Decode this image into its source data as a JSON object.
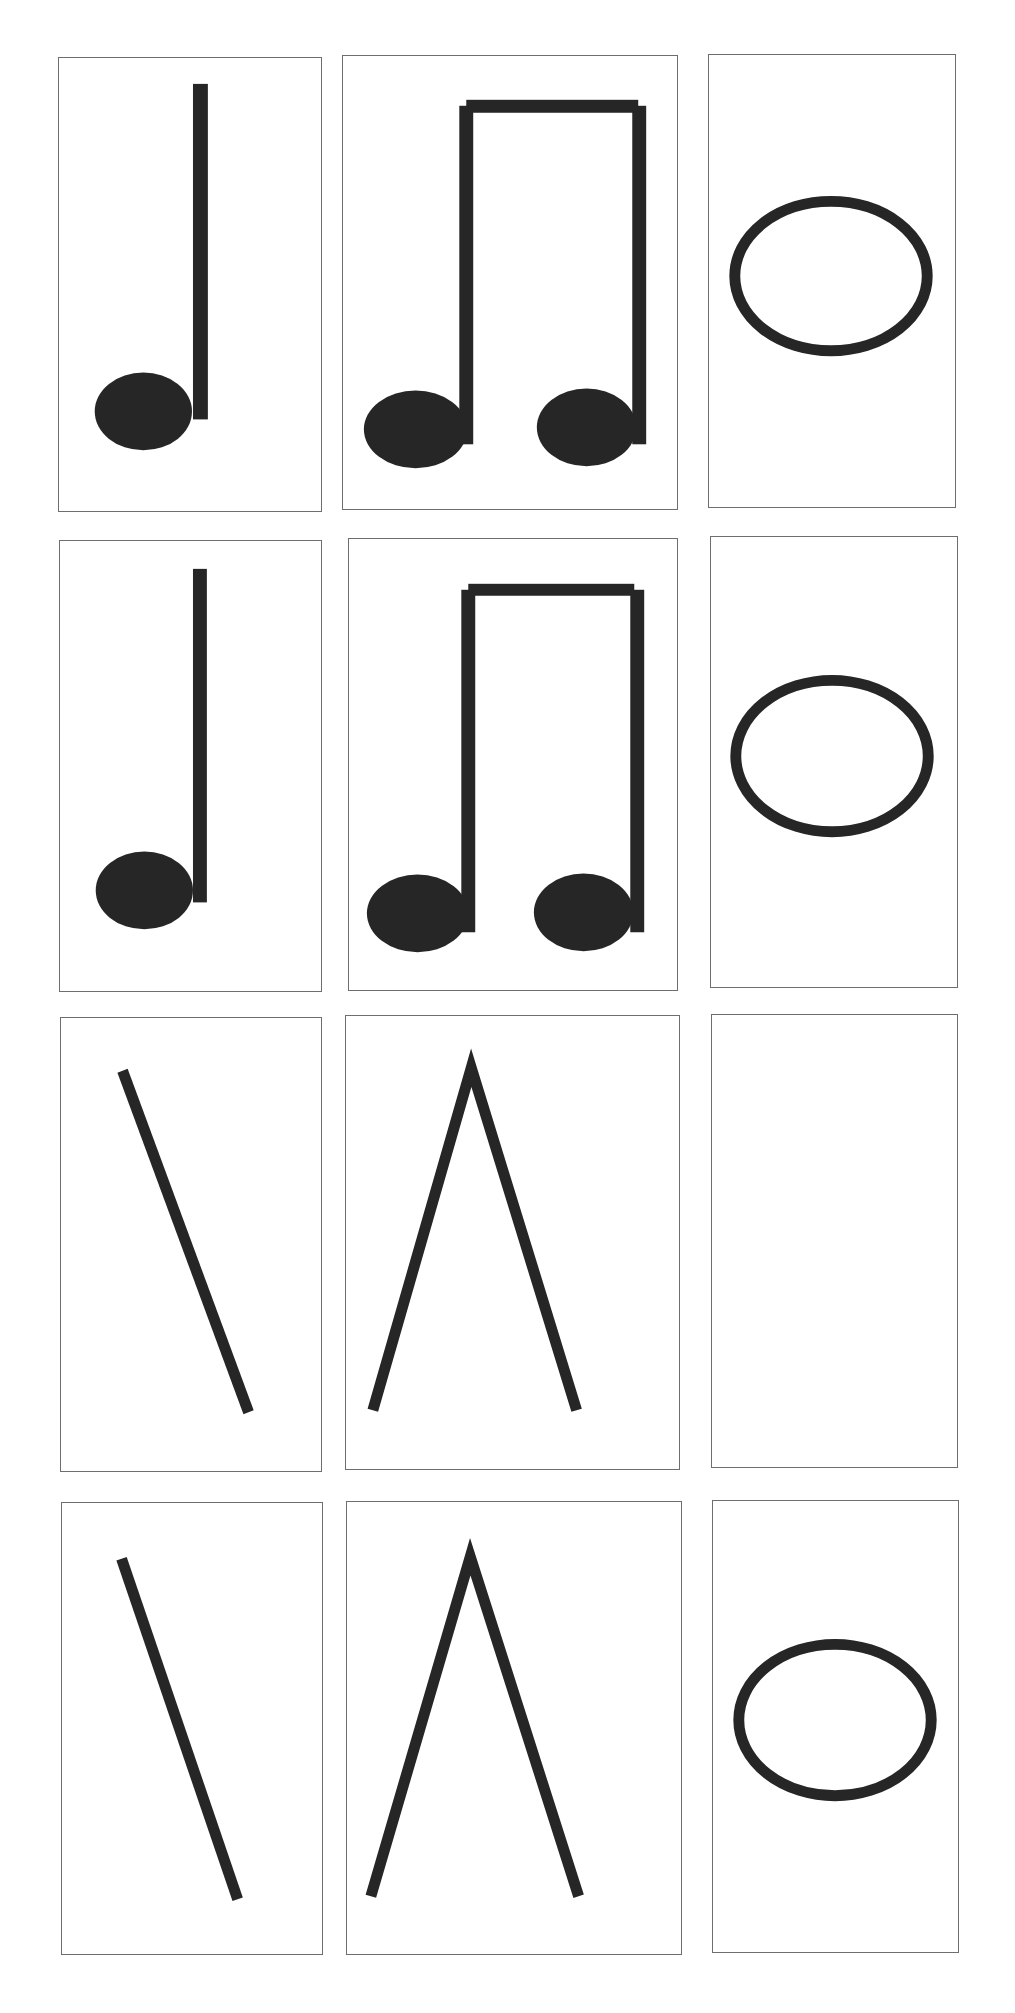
{
  "page": {
    "title": "",
    "title_note": "clipped at top edge; only descender fragments visible, text not legible"
  },
  "colors": {
    "ink": "#262626",
    "card_border": "#6e6e6e",
    "background": "#ffffff"
  },
  "grid": {
    "rows": 4,
    "columns": 3,
    "cards": [
      {
        "row": 1,
        "col": 1,
        "symbol": "quarter-note-icon",
        "notation": "standard"
      },
      {
        "row": 1,
        "col": 2,
        "symbol": "beamed-eighth-notes-icon",
        "notation": "standard"
      },
      {
        "row": 1,
        "col": 3,
        "symbol": "whole-note-icon",
        "notation": "standard"
      },
      {
        "row": 2,
        "col": 1,
        "symbol": "quarter-note-icon",
        "notation": "standard"
      },
      {
        "row": 2,
        "col": 2,
        "symbol": "beamed-eighth-notes-icon",
        "notation": "standard"
      },
      {
        "row": 2,
        "col": 3,
        "symbol": "whole-note-icon",
        "notation": "standard"
      },
      {
        "row": 3,
        "col": 1,
        "symbol": "stick-quarter-icon",
        "notation": "stick"
      },
      {
        "row": 3,
        "col": 2,
        "symbol": "stick-eighths-icon",
        "notation": "stick"
      },
      {
        "row": 3,
        "col": 3,
        "symbol": "none",
        "notation": "blank"
      },
      {
        "row": 4,
        "col": 1,
        "symbol": "stick-quarter-icon",
        "notation": "stick"
      },
      {
        "row": 4,
        "col": 2,
        "symbol": "stick-eighths-icon",
        "notation": "stick"
      },
      {
        "row": 4,
        "col": 3,
        "symbol": "whole-note-icon",
        "notation": "standard"
      }
    ]
  }
}
